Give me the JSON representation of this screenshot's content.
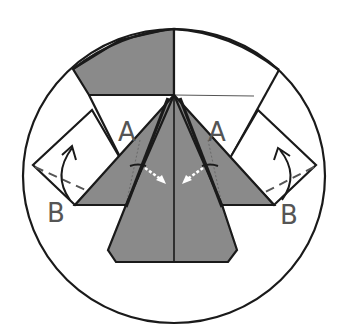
{
  "diagram": {
    "type": "origami-folding-step",
    "labels": {
      "a_left": "A",
      "a_right": "A",
      "b_left": "B",
      "b_right": "B"
    },
    "colors": {
      "paper_colored": "#8a8a8a",
      "paper_white": "#ffffff",
      "stroke": "#1a1a1a",
      "label": "#555555",
      "fold_arrow_dotted": "#ffffff"
    },
    "annotations": [
      {
        "name": "valley-fold-line-left",
        "style": "dashed",
        "from_point": "left-square-tip",
        "to_point": "B"
      },
      {
        "name": "valley-fold-line-right",
        "style": "dashed",
        "from_point": "right-square-tip",
        "to_point": "B"
      },
      {
        "name": "curved-fold-arrow-left",
        "direction": "up",
        "meaning": "fold flap up"
      },
      {
        "name": "curved-fold-arrow-right",
        "direction": "up",
        "meaning": "fold flap up"
      },
      {
        "name": "dotted-arrow-left",
        "direction": "toward-center",
        "meaning": "tuck inside"
      },
      {
        "name": "dotted-arrow-right",
        "direction": "toward-center",
        "meaning": "tuck inside"
      }
    ]
  }
}
